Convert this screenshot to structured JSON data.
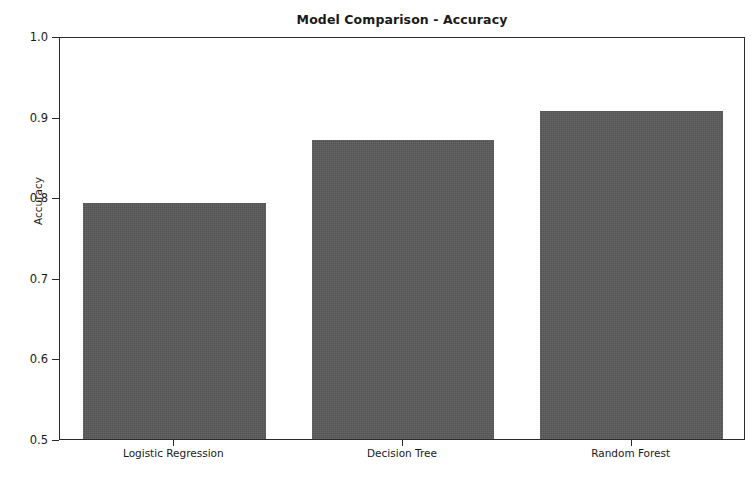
{
  "chart_data": {
    "type": "bar",
    "title": "Model Comparison - Accuracy",
    "xlabel": "",
    "ylabel": "Accuracy",
    "categories": [
      "Logistic Regression",
      "Decision Tree",
      "Random Forest"
    ],
    "values": [
      0.793,
      0.871,
      0.907
    ],
    "ylim": [
      0.5,
      1.0
    ],
    "yticks": [
      "0.5",
      "0.6",
      "0.7",
      "0.8",
      "0.9",
      "1.0"
    ],
    "ytick_values": [
      0.5,
      0.6,
      0.7,
      0.8,
      0.9,
      1.0
    ],
    "grid": false,
    "legend": null,
    "bar_color": "#5a5a5a",
    "background_color": "#ffffff",
    "axis_color": "#2a2a2a"
  }
}
